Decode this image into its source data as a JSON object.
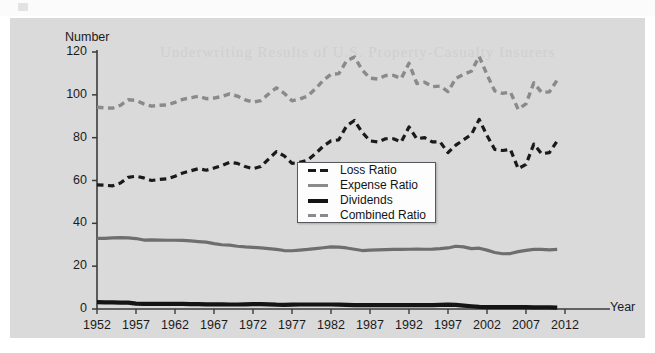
{
  "figure": {
    "panel_bg": "#dadada",
    "page_bg": "#ffffff"
  },
  "chart_data": {
    "type": "line",
    "title": "",
    "subtitle": "",
    "xlabel": "Year",
    "ylabel": "Number",
    "grid": false,
    "legend_position": "center",
    "xlim": [
      1952,
      2012
    ],
    "ylim": [
      0,
      120
    ],
    "ytick_labels": [
      "0",
      "20",
      "40",
      "60",
      "80",
      "100",
      "120"
    ],
    "yticks": [
      0,
      20,
      40,
      60,
      80,
      100,
      120
    ],
    "xtick_labels": [
      "1952",
      "1957",
      "1962",
      "1967",
      "1972",
      "1977",
      "1982",
      "1987",
      "1992",
      "1997",
      "2002",
      "2007",
      "2012"
    ],
    "xticks": [
      1952,
      1957,
      1962,
      1967,
      1972,
      1977,
      1982,
      1987,
      1992,
      1997,
      2002,
      2007,
      2012
    ],
    "x": [
      1952,
      1953,
      1954,
      1955,
      1956,
      1957,
      1958,
      1959,
      1960,
      1961,
      1962,
      1963,
      1964,
      1965,
      1966,
      1967,
      1968,
      1969,
      1970,
      1971,
      1972,
      1973,
      1974,
      1975,
      1976,
      1977,
      1978,
      1979,
      1980,
      1981,
      1982,
      1983,
      1984,
      1985,
      1986,
      1987,
      1988,
      1989,
      1990,
      1991,
      1992,
      1993,
      1994,
      1995,
      1996,
      1997,
      1998,
      1999,
      2000,
      2001,
      2002,
      2003,
      2004,
      2005,
      2006,
      2007,
      2008,
      2009,
      2010,
      2011
    ],
    "series": [
      {
        "name": "Loss Ratio",
        "color": "#1a1a1a",
        "style": "dashed",
        "width": 3.2,
        "values": [
          58.0,
          57.8,
          57.5,
          58.8,
          61.5,
          62.0,
          61.2,
          60.0,
          60.5,
          60.8,
          62.0,
          63.5,
          64.5,
          65.5,
          64.8,
          65.8,
          67.0,
          68.5,
          68.0,
          66.5,
          65.5,
          66.5,
          70.0,
          73.5,
          71.5,
          68.0,
          68.5,
          69.5,
          72.5,
          76.0,
          78.5,
          79.0,
          85.5,
          88.0,
          82.5,
          78.5,
          78.0,
          79.5,
          79.5,
          78.0,
          85.0,
          79.5,
          80.0,
          78.0,
          78.0,
          73.0,
          76.5,
          79.0,
          81.5,
          88.5,
          81.0,
          74.5,
          74.0,
          74.5,
          65.5,
          67.5,
          77.0,
          72.5,
          73.0,
          78.5
        ]
      },
      {
        "name": "Expense Ratio",
        "color": "#6e6e6e",
        "style": "solid",
        "width": 3.2,
        "values": [
          33.0,
          33.0,
          33.2,
          33.3,
          33.2,
          32.9,
          32.2,
          32.3,
          32.2,
          32.1,
          32.1,
          32.0,
          31.8,
          31.5,
          31.2,
          30.5,
          30.0,
          29.8,
          29.3,
          29.0,
          28.8,
          28.5,
          28.2,
          27.8,
          27.3,
          27.2,
          27.5,
          27.8,
          28.2,
          28.6,
          29.0,
          28.9,
          28.5,
          27.9,
          27.3,
          27.5,
          27.6,
          27.7,
          27.8,
          27.8,
          27.9,
          28.0,
          27.9,
          28.0,
          28.2,
          28.5,
          29.3,
          29.0,
          28.2,
          28.4,
          27.5,
          26.4,
          25.8,
          25.9,
          26.8,
          27.4,
          27.8,
          27.8,
          27.6,
          27.8
        ]
      },
      {
        "name": "Dividends",
        "color": "#141414",
        "style": "solid",
        "width": 4.2,
        "values": [
          3.2,
          3.1,
          3.1,
          3.0,
          3.0,
          2.5,
          2.4,
          2.4,
          2.4,
          2.4,
          2.4,
          2.4,
          2.3,
          2.3,
          2.2,
          2.2,
          2.2,
          2.1,
          2.1,
          2.2,
          2.3,
          2.3,
          2.2,
          2.0,
          1.9,
          2.0,
          2.1,
          2.1,
          2.1,
          2.1,
          2.1,
          2.0,
          1.9,
          1.8,
          1.8,
          1.8,
          1.8,
          1.8,
          1.8,
          1.8,
          1.8,
          1.8,
          1.8,
          1.8,
          1.9,
          2.0,
          1.9,
          1.6,
          1.3,
          1.0,
          0.9,
          0.9,
          0.9,
          0.9,
          0.9,
          0.9,
          0.8,
          0.8,
          0.8,
          0.6
        ]
      },
      {
        "name": "Combined Ratio",
        "color": "#8a8a8a",
        "style": "dashed",
        "width": 3.4,
        "values": [
          94.2,
          93.9,
          93.8,
          95.1,
          97.7,
          97.4,
          95.8,
          94.7,
          95.1,
          95.3,
          96.5,
          97.9,
          98.6,
          99.3,
          98.2,
          98.5,
          99.2,
          100.4,
          99.4,
          97.7,
          96.6,
          97.3,
          100.4,
          103.3,
          100.7,
          97.2,
          98.1,
          99.4,
          102.8,
          106.7,
          109.6,
          109.9,
          115.9,
          117.7,
          111.6,
          107.8,
          107.4,
          109.0,
          109.1,
          107.6,
          114.7,
          105.3,
          105.9,
          103.8,
          104.1,
          101.5,
          107.7,
          109.6,
          111.0,
          117.9,
          109.4,
          101.8,
          100.7,
          101.3,
          93.2,
          95.8,
          105.6,
          101.1,
          101.4,
          106.9
        ]
      }
    ]
  },
  "legend": {
    "items": [
      {
        "label": "Loss Ratio",
        "swatch": "dashed-black"
      },
      {
        "label": "Expense Ratio",
        "swatch": "solid-gray"
      },
      {
        "label": "Dividends",
        "swatch": "solid-black"
      },
      {
        "label": "Combined Ratio",
        "swatch": "dashed-gray"
      }
    ]
  },
  "ghost_text": {
    "line1": "Underwriting Results of U.S. Property-Casualty Insurers"
  }
}
